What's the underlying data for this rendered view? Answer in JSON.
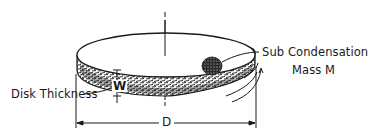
{
  "figure": {
    "labels": {
      "sub_condensation_line1": "Sub Condensation",
      "sub_condensation_line2": "Mass M",
      "disk_thickness": "Disk Thickness",
      "thickness_symbol": "W",
      "diameter_symbol": "D"
    },
    "elements": {
      "disk": "rotating flat disk with textured rim",
      "central_axis": "vertical rotation axis",
      "sub_condensation_mass": "dark textured blob on disk top surface",
      "rotation_arrows": "curved arrows at right rim indicating rotation",
      "diameter_dimension": "horizontal dimension line D with extension lines",
      "thickness_dimension": "vertical dimension W at front rim"
    },
    "colors": {
      "ink": "#1a1a1a",
      "background": "#ffffff"
    }
  }
}
